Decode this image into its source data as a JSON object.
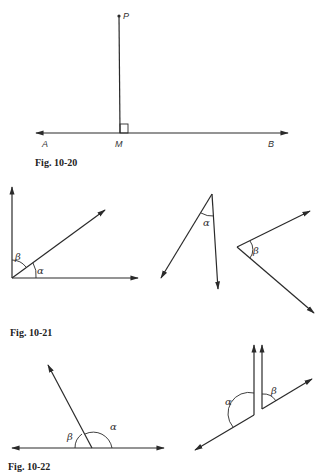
{
  "header_fragment": "...",
  "figures": [
    {
      "id": "fig-10-20",
      "caption": "Fig. 10-20",
      "labels": {
        "point": "P",
        "foot": "M",
        "left": "A",
        "right": "B"
      },
      "description": "Perpendicular segment from point P to line AB meeting at M with right-angle mark"
    },
    {
      "id": "fig-10-21",
      "caption": "Fig. 10-21",
      "labels": {
        "alpha": "α",
        "beta": "β"
      },
      "description": "Three angle diagrams: complementary angles α and β; acute angle α; angle β"
    },
    {
      "id": "fig-10-22",
      "caption": "Fig. 10-22",
      "labels": {
        "alpha": "α",
        "beta": "β"
      },
      "description": "Supplementary angles α and β on a line; two angles with parallel sides α and β"
    }
  ]
}
